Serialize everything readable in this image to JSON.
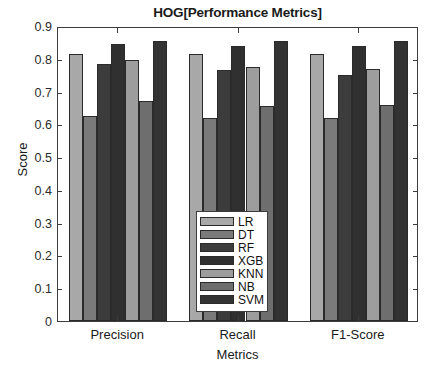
{
  "chart_data": {
    "type": "bar",
    "title": "HOG[Performance Metrics]",
    "xlabel": "Metrics",
    "ylabel": "Score",
    "categories": [
      "Precision",
      "Recall",
      "F1-Score"
    ],
    "ylim": [
      0,
      0.9
    ],
    "yticks": [
      "0",
      "0.1",
      "0.2",
      "0.3",
      "0.4",
      "0.5",
      "0.6",
      "0.7",
      "0.8",
      "0.9"
    ],
    "ytick_values": [
      0,
      0.1,
      0.2,
      0.3,
      0.4,
      0.5,
      0.6,
      0.7,
      0.8,
      0.9
    ],
    "grid": false,
    "legend_position": "center",
    "series": [
      {
        "name": "LR",
        "color": "#a8a8a8",
        "values": [
          0.815,
          0.815,
          0.815
        ]
      },
      {
        "name": "DT",
        "color": "#7a7a7a",
        "values": [
          0.625,
          0.62,
          0.62
        ]
      },
      {
        "name": "RF",
        "color": "#3c3c3c",
        "values": [
          0.785,
          0.765,
          0.75
        ]
      },
      {
        "name": "XGB",
        "color": "#303030",
        "values": [
          0.845,
          0.84,
          0.84
        ]
      },
      {
        "name": "KNN",
        "color": "#9d9d9d",
        "values": [
          0.795,
          0.775,
          0.77
        ]
      },
      {
        "name": "NB",
        "color": "#6e6e6e",
        "values": [
          0.67,
          0.655,
          0.66
        ]
      },
      {
        "name": "SVM",
        "color": "#333333",
        "values": [
          0.855,
          0.855,
          0.855
        ]
      }
    ]
  },
  "legend": {
    "items": [
      {
        "label": "LR"
      },
      {
        "label": "DT"
      },
      {
        "label": "RF"
      },
      {
        "label": "XGB"
      },
      {
        "label": "KNN"
      },
      {
        "label": "NB"
      },
      {
        "label": "SVM"
      }
    ]
  }
}
